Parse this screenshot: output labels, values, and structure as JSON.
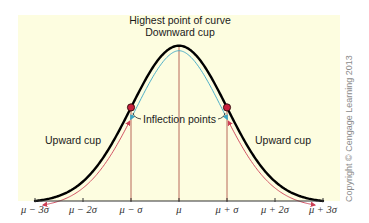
{
  "figure": {
    "background_color": "#ffffff",
    "panel_color": "#fdfde0",
    "curve_color": "#000000",
    "guide_line_color": "#b0574a",
    "upward_arrow_color": "#cc3f55",
    "downward_arrow_color": "#3aa6c4",
    "inflection_point_color": "#c8203c",
    "axis_color": "#333333"
  },
  "annotations": {
    "peak_label": "Highest point of curve",
    "downward_label": "Downward cup",
    "inflection_label": "Inflection points",
    "upward_left_label": "Upward cup",
    "upward_right_label": "Upward cup"
  },
  "copyright": "Copyright © Cengage Learning 2013",
  "chart_data": {
    "type": "line",
    "title": "",
    "xlabel": "",
    "ylabel": "",
    "x_ticks": [
      "μ − 3σ",
      "μ − 2σ",
      "μ − σ",
      "μ",
      "μ + σ",
      "μ + 2σ",
      "μ + 3σ"
    ],
    "x_tick_values": [
      -3,
      -2,
      -1,
      0,
      1,
      2,
      3
    ],
    "xlim": [
      -3,
      3
    ],
    "series": [
      {
        "name": "normal density",
        "function": "exp(-z^2/2)",
        "x": [
          -3,
          -2.5,
          -2,
          -1.5,
          -1,
          -0.5,
          0,
          0.5,
          1,
          1.5,
          2,
          2.5,
          3
        ],
        "values": [
          0.011,
          0.044,
          0.135,
          0.325,
          0.607,
          0.882,
          1.0,
          0.882,
          0.607,
          0.325,
          0.135,
          0.044,
          0.011
        ]
      }
    ],
    "vertical_guides": [
      -1,
      0,
      1
    ],
    "inflection_points": [
      {
        "x": -1,
        "y": 0.607
      },
      {
        "x": 1,
        "y": 0.607
      }
    ],
    "regions": [
      {
        "name": "Upward cup",
        "from": -3,
        "to": -1
      },
      {
        "name": "Downward cup",
        "from": -1,
        "to": 1
      },
      {
        "name": "Upward cup",
        "from": 1,
        "to": 3
      }
    ],
    "grid": false,
    "legend": "none"
  },
  "layout": {
    "panel": {
      "x": 18,
      "y": 15,
      "w": 322,
      "h": 186
    },
    "axis_y": 201,
    "x_left": 35,
    "x_right": 323,
    "peak_y": 44
  }
}
